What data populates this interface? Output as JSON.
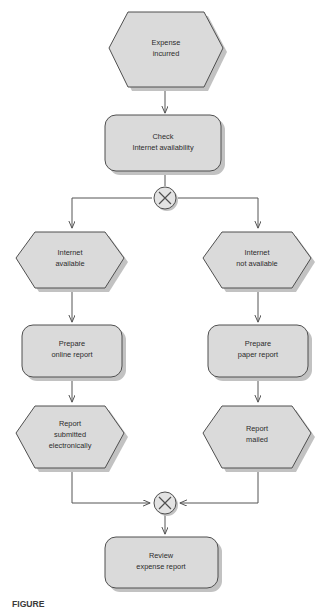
{
  "diagram": {
    "type": "flowchart",
    "colors": {
      "node_fill": "#dadada",
      "node_stroke": "#4f4f4f",
      "shadow": "#c2c2c2",
      "connector": "#555555",
      "text": "#2b2b2b",
      "background": "#ffffff",
      "junction_fill": "#e3e3e3"
    },
    "nodes": {
      "expense_incurred": {
        "shape": "hexagon",
        "lines": [
          "Expense",
          "incurred"
        ]
      },
      "check_internet": {
        "shape": "rounded-rectangle",
        "lines": [
          "Check",
          "Internet availability"
        ]
      },
      "internet_available": {
        "shape": "hexagon",
        "lines": [
          "Internet",
          "available"
        ]
      },
      "internet_not_available": {
        "shape": "hexagon",
        "lines": [
          "Internet",
          "not available"
        ]
      },
      "prepare_online_report": {
        "shape": "rounded-rectangle",
        "lines": [
          "Prepare",
          "online report"
        ]
      },
      "prepare_paper_report": {
        "shape": "rounded-rectangle",
        "lines": [
          "Prepare",
          "paper report"
        ]
      },
      "report_submitted": {
        "shape": "hexagon",
        "lines": [
          "Report",
          "submitted",
          "electronically"
        ]
      },
      "report_mailed": {
        "shape": "hexagon",
        "lines": [
          "Report",
          "mailed"
        ]
      },
      "review_expense_report": {
        "shape": "rounded-rectangle",
        "lines": [
          "Review",
          "expense report"
        ]
      }
    },
    "junctions": {
      "split_gateway": {
        "symbol": "X",
        "role": "split"
      },
      "merge_gateway": {
        "symbol": "X",
        "role": "merge"
      }
    },
    "caption": {
      "text": "FIGURE",
      "clipped": true
    }
  }
}
